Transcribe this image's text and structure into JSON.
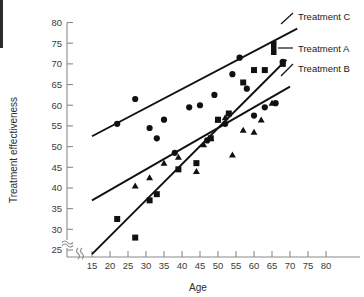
{
  "chart_data": {
    "type": "scatter",
    "title": "",
    "xlabel": "Age",
    "ylabel": "Treatment effectiveness",
    "xlim": [
      12,
      82
    ],
    "ylim": [
      22,
      81
    ],
    "xticks": [
      15,
      20,
      25,
      30,
      35,
      40,
      45,
      50,
      55,
      60,
      65,
      70,
      75,
      80
    ],
    "yticks": [
      25,
      30,
      35,
      40,
      45,
      50,
      55,
      60,
      65,
      70,
      75,
      80
    ],
    "axis_break_x": true,
    "axis_break_y": true,
    "grid": false,
    "legend_position": "right",
    "series": [
      {
        "name": "Treatment C",
        "marker": "circle",
        "points": [
          [
            22,
            55.5
          ],
          [
            27,
            61.5
          ],
          [
            31,
            54.5
          ],
          [
            33,
            52.0
          ],
          [
            35,
            56.5
          ],
          [
            38,
            48.5
          ],
          [
            42,
            59.5
          ],
          [
            45,
            60.0
          ],
          [
            47,
            51.5
          ],
          [
            49,
            62.5
          ],
          [
            52,
            55.5
          ],
          [
            54,
            67.5
          ],
          [
            56,
            71.5
          ],
          [
            58,
            64.0
          ],
          [
            60,
            57.5
          ],
          [
            63,
            59.5
          ],
          [
            66,
            60.5
          ],
          [
            68,
            70.5
          ]
        ],
        "trend": {
          "x1": 15,
          "y1": 52.5,
          "x2": 72,
          "y2": 78.5
        }
      },
      {
        "name": "Treatment A",
        "marker": "square",
        "points": [
          [
            22,
            32.5
          ],
          [
            27,
            28.0
          ],
          [
            31,
            37.0
          ],
          [
            33,
            38.5
          ],
          [
            39,
            44.5
          ],
          [
            44,
            46.0
          ],
          [
            48,
            52.0
          ],
          [
            50,
            56.5
          ],
          [
            53,
            58.0
          ],
          [
            57,
            65.5
          ],
          [
            60,
            68.5
          ],
          [
            63,
            68.5
          ],
          [
            68,
            70.0
          ]
        ],
        "trend": {
          "x1": 15,
          "y1": 24.0,
          "x2": 69,
          "y2": 71.0
        }
      },
      {
        "name": "Treatment B",
        "marker": "triangle",
        "points": [
          [
            27,
            40.5
          ],
          [
            31,
            42.5
          ],
          [
            35,
            46.0
          ],
          [
            39,
            47.5
          ],
          [
            44,
            44.0
          ],
          [
            46,
            50.5
          ],
          [
            48,
            52.0
          ],
          [
            50,
            56.5
          ],
          [
            52,
            57.0
          ],
          [
            54,
            48.0
          ],
          [
            57,
            54.0
          ],
          [
            60,
            53.5
          ],
          [
            62,
            56.5
          ],
          [
            65,
            60.5
          ]
        ],
        "trend": {
          "x1": 15,
          "y1": 37.0,
          "x2": 70,
          "y2": 64.5
        }
      }
    ],
    "legend": [
      {
        "label": "Treatment C",
        "marker": "line"
      },
      {
        "label": "Treatment A",
        "marker": "bar"
      },
      {
        "label": "Treatment B",
        "marker": "line"
      }
    ]
  }
}
